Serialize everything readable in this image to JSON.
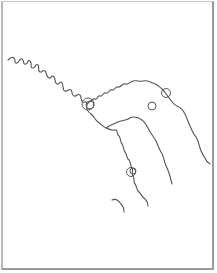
{
  "map": {
    "background": "#ffffff",
    "frame_color": "#9a9a9a",
    "river_color": "#555555",
    "rivers": [
      {
        "name": "main-river-west",
        "path": "M8,60 C10,58 12,56 14,58 C16,60 14,64 17,63 C20,62 19,58 22,59 C25,60 22,65 26,64 C29,63 27,59 30,61 C33,63 29,68 33,68 C36,68 35,63 38,65 C40,67 37,71 40,72 C43,73 42,69 45,71 C47,73 46,77 49,78 C52,79 51,74 54,77 C56,79 54,83 57,84 C60,85 60,80 62,83 C64,86 62,90 65,91 C68,92 68,88 71,90 C73,92 71,95 74,96 C77,97 77,93 80,95 C82,97 80,101 83,102 C85,103 86,100 87,104"
      },
      {
        "name": "main-river-northeast",
        "path": "M87,104 C90,102 92,98 95,99 C98,100 97,95 100,96 C103,97 103,92 106,93 C109,94 109,89 112,90 C115,91 115,86 118,87 C121,88 122,83 125,84 C128,85 130,82 133,81 C137,80 140,82 143,81 C147,80 150,82 153,83 C157,84 160,87 163,90 C166,93 167,96 170,99 C172,102 174,105 177,106 C180,107 183,110 185,114 C187,118 188,122 190,126 C192,130 193,134 196,137 C198,140 199,144 200,148 C201,152 203,155 205,158 C206,161 208,163 210,164"
      },
      {
        "name": "south-branch",
        "path": "M87,104 C86,108 88,112 91,114 C94,116 95,120 98,122 C101,124 103,127 106,128 C109,129 112,131 115,130 C118,129 116,134 119,136 C121,138 120,142 122,144 C124,146 123,150 125,152 C127,154 126,158 129,160 C131,162 130,166 132,168 C134,170 131,174 133,176 C135,178 133,182 135,184 C137,186 136,190 139,192 C141,194 142,197 145,199 C147,201 148,204 148,206"
      },
      {
        "name": "middle-branch",
        "path": "M106,128 C110,125 114,124 118,122 C122,120 126,121 130,118 C134,116 138,117 142,120 C145,122 147,126 149,130 C151,134 154,137 156,141 C158,145 159,149 161,152 C163,155 164,159 165,163 C166,166 168,170 169,173 C170,176 171,180 172,184"
      },
      {
        "name": "southwest-branch",
        "path": "M112,200 C116,198 119,201 121,204 C123,206 124,209 124,212"
      }
    ],
    "markers": [
      {
        "name": "junction-marker",
        "cx": 88,
        "cy": 104,
        "r": 6
      },
      {
        "name": "junction-marker-inner",
        "cx": 90,
        "cy": 105,
        "r": 4
      },
      {
        "name": "northeast-river-marker",
        "cx": 166,
        "cy": 93,
        "r": 4.5
      },
      {
        "name": "isolated-marker",
        "cx": 152,
        "cy": 106,
        "r": 4
      },
      {
        "name": "south-branch-marker",
        "cx": 131,
        "cy": 172,
        "r": 4.5
      },
      {
        "name": "south-branch-marker-inner",
        "cx": 133,
        "cy": 171,
        "r": 3
      }
    ]
  }
}
